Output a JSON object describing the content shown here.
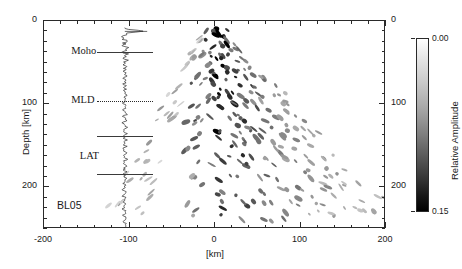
{
  "figure": {
    "station_label": "BL05",
    "axes": {
      "x": {
        "title": "[km]",
        "ticks": [
          -200,
          -100,
          0,
          100,
          200
        ],
        "tick_labels": [
          "-200",
          "-100",
          "0",
          "100",
          "200"
        ],
        "range": [
          -200,
          200
        ],
        "minor_step": 20
      },
      "y_left": {
        "title": "Depth [km]",
        "ticks": [
          0,
          100,
          200
        ],
        "tick_labels": [
          "0",
          "100",
          "200"
        ],
        "range": [
          0,
          250
        ],
        "minor_step": 12.5
      },
      "y_right": {
        "title": "",
        "ticks": [
          0,
          100,
          200
        ],
        "tick_labels": [
          "0",
          "100",
          "200"
        ],
        "range": [
          0,
          250
        ]
      }
    },
    "annotations": [
      {
        "name": "moho",
        "label": "Moho",
        "depth_km": 38,
        "line_style": "solid"
      },
      {
        "name": "mld",
        "label": "MLD",
        "depth_km": 97,
        "line_style": "dotted"
      },
      {
        "name": "lat",
        "label": "LAT",
        "depth_km": 140,
        "line_style": "solid"
      },
      {
        "name": "lat-2",
        "label": "",
        "depth_km": 185,
        "line_style": "solid"
      }
    ],
    "colorbar": {
      "title": "Relative Amplitude",
      "min_label": "0.00",
      "max_label": "0.15",
      "min_value": 0.0,
      "max_value": 0.15,
      "low_color": "#ffffff",
      "high_color": "#000000"
    }
  },
  "chart_data": {
    "type": "scatter",
    "title": "",
    "xlabel": "[km]",
    "ylabel": "Depth [km]",
    "xlim": [
      -200,
      200
    ],
    "ylim": [
      250,
      0
    ],
    "grid": false,
    "legend": null,
    "colormap": "grayscale_inverted",
    "colorbar_label": "Relative Amplitude",
    "colorbar_range": [
      0.0,
      0.15
    ],
    "series": [
      {
        "name": "waveform_trace",
        "type": "line",
        "x_center_km": -105,
        "amplitude_scale_km": 11,
        "depth_range_km": [
          8,
          250
        ],
        "note": "Vertical receiver-function stack plotted at x = -105 km; a large positive surface spike at ~12 km depth followed by oscillatory coda to the base of the section."
      },
      {
        "name": "migrated_scatterers",
        "type": "scatter",
        "note": "Elongated dark blobs; amplitude maps to darkness via the grayscale colorbar (0.00 white to 0.15 black).",
        "points": [
          {
            "x": 2,
            "y": 10,
            "a": 0.15
          },
          {
            "x": 8,
            "y": 11,
            "a": 0.14
          },
          {
            "x": -4,
            "y": 14,
            "a": 0.1
          },
          {
            "x": 5,
            "y": 22,
            "a": 0.15
          },
          {
            "x": 12,
            "y": 24,
            "a": 0.12
          },
          {
            "x": -2,
            "y": 27,
            "a": 0.11
          },
          {
            "x": 9,
            "y": 32,
            "a": 0.15
          },
          {
            "x": 18,
            "y": 30,
            "a": 0.09
          },
          {
            "x": -8,
            "y": 34,
            "a": 0.08
          },
          {
            "x": 3,
            "y": 40,
            "a": 0.13
          },
          {
            "x": 16,
            "y": 42,
            "a": 0.12
          },
          {
            "x": 26,
            "y": 38,
            "a": 0.1
          },
          {
            "x": -12,
            "y": 45,
            "a": 0.07
          },
          {
            "x": 10,
            "y": 50,
            "a": 0.14
          },
          {
            "x": 22,
            "y": 52,
            "a": 0.11
          },
          {
            "x": 34,
            "y": 48,
            "a": 0.09
          },
          {
            "x": -6,
            "y": 56,
            "a": 0.1
          },
          {
            "x": 6,
            "y": 62,
            "a": 0.13
          },
          {
            "x": 20,
            "y": 64,
            "a": 0.12
          },
          {
            "x": 33,
            "y": 60,
            "a": 0.1
          },
          {
            "x": 44,
            "y": 58,
            "a": 0.08
          },
          {
            "x": -16,
            "y": 66,
            "a": 0.08
          },
          {
            "x": 0,
            "y": 72,
            "a": 0.14
          },
          {
            "x": 14,
            "y": 75,
            "a": 0.12
          },
          {
            "x": 28,
            "y": 73,
            "a": 0.11
          },
          {
            "x": 42,
            "y": 70,
            "a": 0.09
          },
          {
            "x": 55,
            "y": 68,
            "a": 0.07
          },
          {
            "x": -20,
            "y": 78,
            "a": 0.09
          },
          {
            "x": 8,
            "y": 85,
            "a": 0.13
          },
          {
            "x": 24,
            "y": 87,
            "a": 0.12
          },
          {
            "x": 38,
            "y": 84,
            "a": 0.1
          },
          {
            "x": 52,
            "y": 82,
            "a": 0.09
          },
          {
            "x": 66,
            "y": 80,
            "a": 0.07
          },
          {
            "x": -10,
            "y": 92,
            "a": 0.11
          },
          {
            "x": 4,
            "y": 96,
            "a": 0.14
          },
          {
            "x": 18,
            "y": 98,
            "a": 0.12
          },
          {
            "x": 34,
            "y": 96,
            "a": 0.11
          },
          {
            "x": 48,
            "y": 94,
            "a": 0.09
          },
          {
            "x": 62,
            "y": 92,
            "a": 0.08
          },
          {
            "x": 76,
            "y": 90,
            "a": 0.06
          },
          {
            "x": -22,
            "y": 102,
            "a": 0.09
          },
          {
            "x": 10,
            "y": 108,
            "a": 0.13
          },
          {
            "x": 26,
            "y": 110,
            "a": 0.12
          },
          {
            "x": 42,
            "y": 108,
            "a": 0.1
          },
          {
            "x": 58,
            "y": 106,
            "a": 0.09
          },
          {
            "x": 72,
            "y": 104,
            "a": 0.08
          },
          {
            "x": 86,
            "y": 102,
            "a": 0.06
          },
          {
            "x": -14,
            "y": 116,
            "a": 0.1
          },
          {
            "x": 2,
            "y": 120,
            "a": 0.13
          },
          {
            "x": 20,
            "y": 122,
            "a": 0.12
          },
          {
            "x": 36,
            "y": 121,
            "a": 0.11
          },
          {
            "x": 54,
            "y": 118,
            "a": 0.09
          },
          {
            "x": 70,
            "y": 116,
            "a": 0.08
          },
          {
            "x": 88,
            "y": 114,
            "a": 0.06
          },
          {
            "x": -26,
            "y": 128,
            "a": 0.08
          },
          {
            "x": 8,
            "y": 132,
            "a": 0.13
          },
          {
            "x": 28,
            "y": 134,
            "a": 0.12
          },
          {
            "x": 46,
            "y": 132,
            "a": 0.1
          },
          {
            "x": 64,
            "y": 130,
            "a": 0.09
          },
          {
            "x": 82,
            "y": 128,
            "a": 0.07
          },
          {
            "x": 100,
            "y": 126,
            "a": 0.06
          },
          {
            "x": -18,
            "y": 142,
            "a": 0.09
          },
          {
            "x": 0,
            "y": 146,
            "a": 0.12
          },
          {
            "x": 18,
            "y": 148,
            "a": 0.12
          },
          {
            "x": 38,
            "y": 147,
            "a": 0.11
          },
          {
            "x": 58,
            "y": 144,
            "a": 0.09
          },
          {
            "x": 78,
            "y": 142,
            "a": 0.08
          },
          {
            "x": 98,
            "y": 140,
            "a": 0.06
          },
          {
            "x": 116,
            "y": 138,
            "a": 0.05
          },
          {
            "x": -28,
            "y": 156,
            "a": 0.08
          },
          {
            "x": 10,
            "y": 160,
            "a": 0.12
          },
          {
            "x": 30,
            "y": 162,
            "a": 0.11
          },
          {
            "x": 52,
            "y": 160,
            "a": 0.1
          },
          {
            "x": 72,
            "y": 158,
            "a": 0.08
          },
          {
            "x": 94,
            "y": 156,
            "a": 0.07
          },
          {
            "x": 114,
            "y": 154,
            "a": 0.05
          },
          {
            "x": -20,
            "y": 170,
            "a": 0.09
          },
          {
            "x": 4,
            "y": 174,
            "a": 0.12
          },
          {
            "x": 24,
            "y": 176,
            "a": 0.11
          },
          {
            "x": 46,
            "y": 175,
            "a": 0.1
          },
          {
            "x": 68,
            "y": 172,
            "a": 0.08
          },
          {
            "x": 90,
            "y": 170,
            "a": 0.07
          },
          {
            "x": 112,
            "y": 168,
            "a": 0.06
          },
          {
            "x": 134,
            "y": 166,
            "a": 0.05
          },
          {
            "x": -30,
            "y": 186,
            "a": 0.07
          },
          {
            "x": 12,
            "y": 190,
            "a": 0.12
          },
          {
            "x": 34,
            "y": 192,
            "a": 0.11
          },
          {
            "x": 58,
            "y": 190,
            "a": 0.09
          },
          {
            "x": 82,
            "y": 188,
            "a": 0.08
          },
          {
            "x": 106,
            "y": 186,
            "a": 0.06
          },
          {
            "x": 130,
            "y": 184,
            "a": 0.05
          },
          {
            "x": 152,
            "y": 182,
            "a": 0.05
          },
          {
            "x": -22,
            "y": 202,
            "a": 0.08
          },
          {
            "x": 6,
            "y": 206,
            "a": 0.11
          },
          {
            "x": 28,
            "y": 208,
            "a": 0.11
          },
          {
            "x": 52,
            "y": 206,
            "a": 0.09
          },
          {
            "x": 78,
            "y": 204,
            "a": 0.08
          },
          {
            "x": 102,
            "y": 202,
            "a": 0.07
          },
          {
            "x": 128,
            "y": 200,
            "a": 0.06
          },
          {
            "x": 154,
            "y": 198,
            "a": 0.05
          },
          {
            "x": 176,
            "y": 196,
            "a": 0.04
          },
          {
            "x": -32,
            "y": 218,
            "a": 0.07
          },
          {
            "x": 14,
            "y": 222,
            "a": 0.11
          },
          {
            "x": 40,
            "y": 224,
            "a": 0.1
          },
          {
            "x": 66,
            "y": 222,
            "a": 0.09
          },
          {
            "x": 92,
            "y": 220,
            "a": 0.07
          },
          {
            "x": 120,
            "y": 218,
            "a": 0.06
          },
          {
            "x": 148,
            "y": 216,
            "a": 0.05
          },
          {
            "x": 172,
            "y": 214,
            "a": 0.04
          },
          {
            "x": 192,
            "y": 212,
            "a": 0.04
          },
          {
            "x": -24,
            "y": 234,
            "a": 0.07
          },
          {
            "x": 8,
            "y": 238,
            "a": 0.1
          },
          {
            "x": 34,
            "y": 240,
            "a": 0.1
          },
          {
            "x": 62,
            "y": 238,
            "a": 0.08
          },
          {
            "x": 90,
            "y": 236,
            "a": 0.07
          },
          {
            "x": 118,
            "y": 234,
            "a": 0.06
          },
          {
            "x": 146,
            "y": 232,
            "a": 0.05
          },
          {
            "x": 174,
            "y": 230,
            "a": 0.04
          },
          {
            "x": 196,
            "y": 228,
            "a": 0.04
          }
        ]
      }
    ]
  }
}
